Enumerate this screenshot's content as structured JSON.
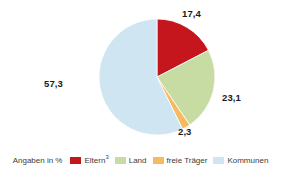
{
  "chart_data": {
    "type": "pie",
    "title": "",
    "subtitle": "",
    "xlabel": "",
    "ylabel": "",
    "unit_note": "Angaben in %",
    "legend_position": "bottom",
    "grid": false,
    "start_angle_deg": 0,
    "direction": "clockwise",
    "categories": [
      "Eltern³",
      "Land",
      "freie Träger",
      "Kommunen"
    ],
    "values": [
      17.4,
      23.1,
      2.3,
      57.3
    ],
    "value_labels": [
      "17,4",
      "23,1",
      "2,3",
      "57,3"
    ],
    "colors": [
      "#C4161C",
      "#C6DCA3",
      "#F6BB62",
      "#CFE5F2"
    ],
    "slices": [
      {
        "label": "Eltern³",
        "label_plain": "Eltern",
        "footnote": "3",
        "value": 17.4,
        "value_label": "17,4",
        "color": "#C4161C"
      },
      {
        "label": "Land",
        "label_plain": "Land",
        "footnote": "",
        "value": 23.1,
        "value_label": "23,1",
        "color": "#C6DCA3"
      },
      {
        "label": "freie Träger",
        "label_plain": "freie Träger",
        "footnote": "",
        "value": 2.3,
        "value_label": "2,3",
        "color": "#F6BB62"
      },
      {
        "label": "Kommunen",
        "label_plain": "Kommunen",
        "footnote": "",
        "value": 57.3,
        "value_label": "57,3",
        "color": "#CFE5F2"
      }
    ]
  },
  "legend": {
    "note": "Angaben in %",
    "items": [
      {
        "label": "Eltern",
        "footnote": "3",
        "color": "#C4161C"
      },
      {
        "label": "Land",
        "footnote": "",
        "color": "#C6DCA3"
      },
      {
        "label": "freie Träger",
        "footnote": "",
        "color": "#F6BB62"
      },
      {
        "label": "Kommunen",
        "footnote": "",
        "color": "#CFE5F2"
      }
    ]
  },
  "labels": {
    "eltern": "17,4",
    "land": "23,1",
    "freie": "2,3",
    "kommunen": "57,3"
  }
}
